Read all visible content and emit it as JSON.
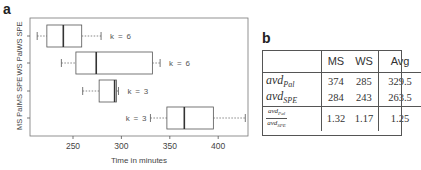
{
  "panel_a": {
    "label": "a"
  },
  "panel_b": {
    "label": "b"
  },
  "chart_data": {
    "type": "boxplot",
    "orientation": "horizontal",
    "xlabel": "Time in minutes",
    "ylabel": "",
    "xlim": [
      205,
      430
    ],
    "xticks": [
      250,
      300,
      350,
      400
    ],
    "categories": [
      "WS SPE",
      "WS Pal",
      "MS SPE",
      "MS Pal"
    ],
    "series": [
      {
        "name": "WS SPE",
        "whisker_low": 213,
        "q1": 223,
        "median": 240,
        "q3": 259,
        "whisker_high": 279,
        "annotation": "k = 6"
      },
      {
        "name": "WS Pal",
        "whisker_low": 238,
        "q1": 253,
        "median": 274,
        "q3": 332,
        "whisker_high": 340,
        "annotation": "k = 6"
      },
      {
        "name": "MS SPE",
        "whisker_low": 260,
        "q1": 277,
        "median": 293,
        "q3": 295,
        "whisker_high": 297,
        "annotation": "k = 3"
      },
      {
        "name": "MS Pal",
        "whisker_low": 330,
        "q1": 347,
        "median": 365,
        "q3": 395,
        "whisker_high": 428,
        "annotation": "k = 3"
      }
    ],
    "grid": false,
    "legend": null
  },
  "table": {
    "columns": [
      "",
      "MS",
      "WS",
      "Avg"
    ],
    "rows": [
      {
        "label_base": "avd",
        "label_sub": "Pal",
        "values": [
          "374",
          "285",
          "329.5"
        ]
      },
      {
        "label_base": "avd",
        "label_sub": "SPE",
        "values": [
          "284",
          "243",
          "263.5"
        ]
      },
      {
        "label_num_base": "avd",
        "label_num_sub": "Pal",
        "label_den_base": "avd",
        "label_den_sub": "SPE",
        "values": [
          "1.32",
          "1.17",
          "1.25"
        ]
      }
    ]
  }
}
